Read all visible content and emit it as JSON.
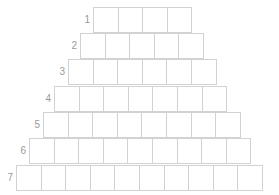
{
  "diagram": {
    "type": "pyramid-grid",
    "line_color": "#d2d2d2",
    "label_color": "#9a9a9a",
    "rows": [
      {
        "label": "1",
        "cells": 4,
        "left": 93,
        "top": 7
      },
      {
        "label": "2",
        "cells": 5,
        "left": 80,
        "top": 33
      },
      {
        "label": "3",
        "cells": 6,
        "left": 68,
        "top": 59
      },
      {
        "label": "4",
        "cells": 7,
        "left": 54,
        "top": 86
      },
      {
        "label": "5",
        "cells": 8,
        "left": 43,
        "top": 112
      },
      {
        "label": "6",
        "cells": 9,
        "left": 29,
        "top": 138
      },
      {
        "label": "7",
        "cells": 10,
        "left": 16,
        "top": 165
      }
    ]
  }
}
